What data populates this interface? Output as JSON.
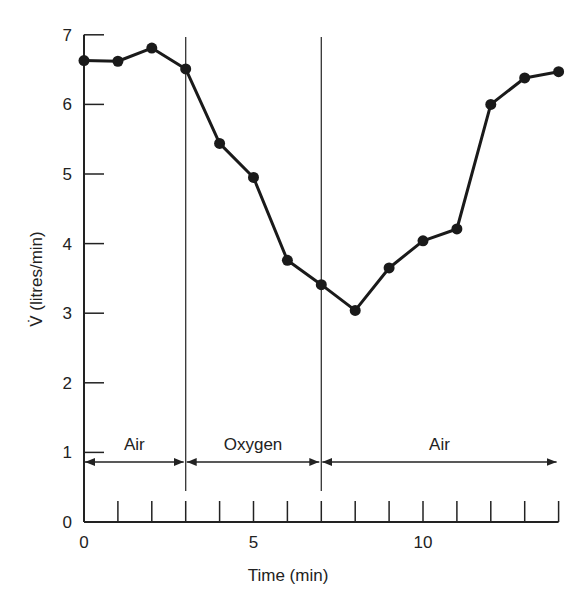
{
  "chart_data": {
    "type": "line",
    "title": "",
    "xlabel": "Time (min)",
    "ylabel": "V̇ (litres/min)",
    "xlim": [
      0,
      14
    ],
    "ylim": [
      0,
      7
    ],
    "grid": false,
    "legend": null,
    "x_ticks": [
      0,
      1,
      2,
      3,
      4,
      5,
      6,
      7,
      8,
      9,
      10,
      11,
      12,
      13,
      14
    ],
    "x_tick_labels": [
      "0",
      "5",
      "10"
    ],
    "x_tick_label_positions": [
      0,
      5,
      10
    ],
    "y_ticks": [
      0,
      1,
      2,
      3,
      4,
      5,
      6,
      7
    ],
    "y_tick_labels": [
      "0",
      "1",
      "2",
      "3",
      "4",
      "5",
      "6",
      "7"
    ],
    "series": [
      {
        "name": "Ventilation",
        "x": [
          0,
          1,
          2,
          3,
          4,
          5,
          6,
          7,
          8,
          9,
          10,
          11,
          12,
          13,
          14
        ],
        "values": [
          6.63,
          6.62,
          6.81,
          6.51,
          5.44,
          4.95,
          3.76,
          3.41,
          3.04,
          3.65,
          4.04,
          4.21,
          6.0,
          6.38,
          6.47
        ]
      }
    ],
    "vertical_markers": [
      3,
      7
    ],
    "annotations": [
      {
        "label": "Air",
        "from": 0,
        "to": 3,
        "y": 0.85
      },
      {
        "label": "Oxygen",
        "from": 3,
        "to": 7,
        "y": 0.85
      },
      {
        "label": "Air",
        "from": 7,
        "to": 14,
        "y": 0.85
      }
    ]
  },
  "axes": {
    "xlabel": "Time (min)",
    "ylabel": "V̇ (litres/min)"
  },
  "phases": [
    {
      "label": "Air"
    },
    {
      "label": "Oxygen"
    },
    {
      "label": "Air"
    }
  ]
}
